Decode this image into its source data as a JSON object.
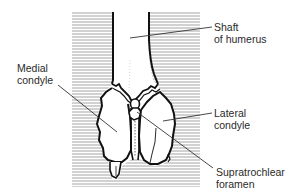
{
  "diagram": {
    "colors": {
      "hatch": "#9a9a9a",
      "outline": "#111111",
      "leader": "#333333",
      "text": "#2a2a2a",
      "background": "#ffffff"
    },
    "labels": {
      "shaft": {
        "line1": "Shaft",
        "line2": "of humerus"
      },
      "medial": {
        "line1": "Medial",
        "line2": "condyle"
      },
      "lateral": {
        "line1": "Lateral",
        "line2": "condyle"
      },
      "supratrochlear": {
        "line1": "Supratrochlear",
        "line2": "foramen"
      }
    }
  }
}
